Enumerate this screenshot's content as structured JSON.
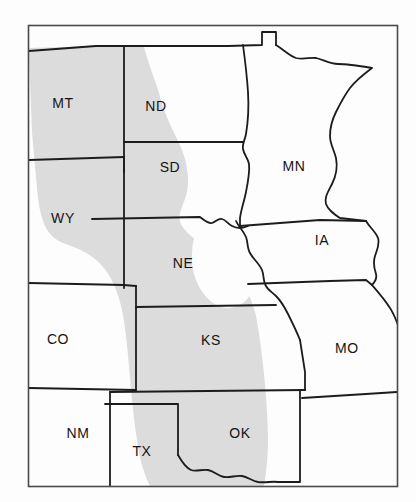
{
  "figure": {
    "type": "thematic-region-map",
    "background_color": "#fdfdfd",
    "frame": {
      "name": "map-border-frame",
      "stroke_color": "#3a3a3a",
      "x": 28,
      "y": 25,
      "width": 370,
      "height": 462
    },
    "shading": {
      "label": "highlighted-region",
      "fill_color": "#dcdcdc",
      "description": "Shaded band covering the Great Plains states"
    },
    "boundary": {
      "state_line_color": "#1c1c1c",
      "state_line_width": 1.8
    }
  },
  "states": [
    {
      "code": "MT",
      "name": "Montana",
      "label_x": 63,
      "label_y": 104,
      "shaded": "full"
    },
    {
      "code": "ND",
      "name": "North Dakota",
      "label_x": 156,
      "label_y": 107,
      "shaded": "partial"
    },
    {
      "code": "SD",
      "name": "South Dakota",
      "label_x": 170,
      "label_y": 168,
      "shaded": "partial"
    },
    {
      "code": "MN",
      "name": "Minnesota",
      "label_x": 294,
      "label_y": 167,
      "shaded": "none"
    },
    {
      "code": "WY",
      "name": "Wyoming",
      "label_x": 63,
      "label_y": 219,
      "shaded": "full"
    },
    {
      "code": "NE",
      "name": "Nebraska",
      "label_x": 183,
      "label_y": 264,
      "shaded": "partial"
    },
    {
      "code": "IA",
      "name": "Iowa",
      "label_x": 322,
      "label_y": 241,
      "shaded": "none"
    },
    {
      "code": "CO",
      "name": "Colorado",
      "label_x": 58,
      "label_y": 340,
      "shaded": "partial"
    },
    {
      "code": "KS",
      "name": "Kansas",
      "label_x": 211,
      "label_y": 341,
      "shaded": "partial"
    },
    {
      "code": "MO",
      "name": "Missouri",
      "label_x": 347,
      "label_y": 349,
      "shaded": "none"
    },
    {
      "code": "NM",
      "name": "New Mexico",
      "label_x": 78,
      "label_y": 434,
      "shaded": "partial"
    },
    {
      "code": "TX",
      "name": "Texas",
      "label_x": 142,
      "label_y": 452,
      "shaded": "full"
    },
    {
      "code": "OK",
      "name": "Oklahoma",
      "label_x": 240,
      "label_y": 434,
      "shaded": "partial"
    }
  ]
}
